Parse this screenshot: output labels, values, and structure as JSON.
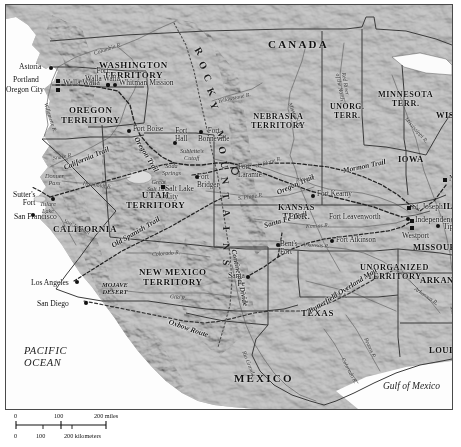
{
  "map": {
    "title": "Western United States Territories and Overland Trails, c. 1850s",
    "colors": {
      "land": "#b2b2b2",
      "ocean": "#ffffff",
      "border": "#3a3a3a",
      "trail": "#2b2b2b",
      "river": "#6b6b6b",
      "text": "#111111"
    },
    "countries": [
      {
        "name": "CANADA",
        "x": 262,
        "y": 33
      },
      {
        "name": "MEXICO",
        "x": 228,
        "y": 367
      }
    ],
    "territories": [
      {
        "name": "WASHINGTON\nTERRITORY",
        "x": 93,
        "y": 55,
        "size": 9
      },
      {
        "name": "OREGON\nTERRITORY",
        "x": 55,
        "y": 100,
        "size": 9
      },
      {
        "name": "UTAH\nTERRITORY",
        "x": 120,
        "y": 185,
        "size": 9
      },
      {
        "name": "NEW MEXICO\nTERRITORY",
        "x": 133,
        "y": 262,
        "size": 9
      },
      {
        "name": "NEBRASKA\nTERRITORY",
        "x": 245,
        "y": 107,
        "size": 8.2
      },
      {
        "name": "KANSAS\nTERR.",
        "x": 272,
        "y": 198,
        "size": 8.2
      },
      {
        "name": "UNORG.\nTERR.",
        "x": 324,
        "y": 98,
        "size": 7.8
      },
      {
        "name": "MINNESOTA\nTERR.",
        "x": 372,
        "y": 85,
        "size": 8.2
      },
      {
        "name": "UNORGANIZED\nTERRITORY",
        "x": 354,
        "y": 258,
        "size": 8.2
      },
      {
        "name": "CALIFORNIA",
        "x": 47,
        "y": 219,
        "size": 9
      },
      {
        "name": "TEXAS",
        "x": 295,
        "y": 303,
        "size": 9
      }
    ],
    "states": [
      {
        "name": "WIS.",
        "x": 430,
        "y": 105
      },
      {
        "name": "IOWA",
        "x": 392,
        "y": 149
      },
      {
        "name": "ILL.",
        "x": 437,
        "y": 196
      },
      {
        "name": "MISSOURI",
        "x": 407,
        "y": 237
      },
      {
        "name": "ARKANSAS",
        "x": 414,
        "y": 270
      },
      {
        "name": "LOUISIANA",
        "x": 423,
        "y": 340
      }
    ],
    "water_labels": [
      {
        "name": "PACIFIC\nOCEAN",
        "x": 18,
        "y": 340,
        "class": "ocean"
      },
      {
        "name": "Gulf of Mexico",
        "x": 377,
        "y": 376,
        "class": "gulf"
      }
    ],
    "mountains": [
      {
        "name": "ROCKY MOUNTAINS",
        "x": 196,
        "y": 40
      }
    ],
    "deserts": [
      {
        "name": "MOJAVE\nDESERT",
        "x": 96,
        "y": 276
      }
    ],
    "features": [
      {
        "name": "Great\nSalt Lake",
        "x": 141,
        "y": 174
      },
      {
        "name": "Donner\nPass",
        "x": 39,
        "y": 168
      },
      {
        "name": "Sublette's\nCutoff",
        "x": 174,
        "y": 143
      },
      {
        "name": "Soda\nSprings",
        "x": 156,
        "y": 158
      },
      {
        "name": "Tulare\nLake",
        "x": 34,
        "y": 196
      }
    ],
    "cities": [
      {
        "name": "Astoria",
        "x": 13,
        "y": 58,
        "marker": "dot",
        "mx": 43,
        "my": 61,
        "align": "right"
      },
      {
        "name": "Portland",
        "x": 7,
        "y": 71,
        "marker": "sq",
        "mx": 50,
        "my": 74,
        "align": "right"
      },
      {
        "name": "Oregon City",
        "x": 0,
        "y": 81,
        "marker": "sq",
        "mx": 50,
        "my": 83,
        "align": "right"
      },
      {
        "name": "Walla Walla",
        "x": 57,
        "y": 74,
        "marker": "dot",
        "mx": 100,
        "my": 78,
        "align": "right"
      },
      {
        "name": "Whitman Mission",
        "x": 113,
        "y": 74,
        "marker": "dot",
        "mx": 107,
        "my": 78,
        "align": "left"
      },
      {
        "name": "Salt Lake\nCity",
        "x": 159,
        "y": 180,
        "marker": "sq",
        "mx": 155,
        "my": 180,
        "align": "left"
      },
      {
        "name": "Sutter's\nFort",
        "x": 7,
        "y": 186,
        "marker": "dot",
        "mx": 45,
        "my": 192,
        "align": "right"
      },
      {
        "name": "San Francisco",
        "x": 8,
        "y": 208,
        "marker": "dot",
        "mx": 25,
        "my": 208,
        "align": "left"
      },
      {
        "name": "Los Angeles",
        "x": 25,
        "y": 274,
        "marker": "dot",
        "mx": 69,
        "my": 275,
        "align": "right"
      },
      {
        "name": "San Diego",
        "x": 31,
        "y": 295,
        "marker": "dot",
        "mx": 78,
        "my": 296,
        "align": "right"
      },
      {
        "name": "Santa\nFe",
        "x": 222,
        "y": 267,
        "marker": "dot",
        "mx": 240,
        "my": 270,
        "align": "right"
      },
      {
        "name": "St. Joseph",
        "x": 406,
        "y": 198,
        "marker": "sq",
        "mx": 401,
        "my": 201,
        "align": "left"
      },
      {
        "name": "Independence",
        "x": 409,
        "y": 211,
        "marker": "sq",
        "mx": 404,
        "my": 214,
        "align": "left"
      },
      {
        "name": "Westport",
        "x": 396,
        "y": 227,
        "marker": "sq",
        "mx": 404,
        "my": 221,
        "align": "right"
      },
      {
        "name": "Tipton",
        "x": 437,
        "y": 218,
        "marker": "dot",
        "mx": 430,
        "my": 219,
        "align": "left"
      },
      {
        "name": "Nauvoo",
        "x": 443,
        "y": 170,
        "marker": "sq",
        "mx": 437,
        "my": 173,
        "align": "left"
      }
    ],
    "forts": [
      {
        "name": "Fort\nWalla Walla",
        "x": 79,
        "y": 63,
        "marker": "dot",
        "mx": 100,
        "my": 78,
        "align": "center"
      },
      {
        "name": "Fort Boise",
        "x": 127,
        "y": 121,
        "marker": "dot",
        "mx": 121,
        "my": 124,
        "align": "left"
      },
      {
        "name": "Fort\nHall",
        "x": 169,
        "y": 123,
        "marker": "dot",
        "mx": 167,
        "my": 136,
        "align": "center"
      },
      {
        "name": "Fort\nBonneville",
        "x": 192,
        "y": 123,
        "marker": "dot",
        "mx": 193,
        "my": 125,
        "align": "center"
      },
      {
        "name": "Fort\nBridger",
        "x": 191,
        "y": 169,
        "marker": "dot",
        "mx": 189,
        "my": 170,
        "align": "left"
      },
      {
        "name": "Fort\nLaramie",
        "x": 232,
        "y": 159,
        "marker": "ring",
        "mx": 225,
        "my": 162,
        "align": "left"
      },
      {
        "name": "Fort Kearny",
        "x": 311,
        "y": 186,
        "marker": "dot",
        "mx": 305,
        "my": 189,
        "align": "left"
      },
      {
        "name": "Fort Leavenworth",
        "x": 323,
        "y": 209,
        "marker": "dot",
        "mx": 400,
        "my": 212,
        "align": "left"
      },
      {
        "name": "Fort Atkinson",
        "x": 330,
        "y": 232,
        "marker": "dot",
        "mx": 324,
        "my": 234,
        "align": "left"
      },
      {
        "name": "Bent's\nFort",
        "x": 274,
        "y": 236,
        "marker": "dot",
        "mx": 270,
        "my": 238,
        "align": "left"
      }
    ],
    "trails": [
      {
        "name": "Oregon Trail",
        "x": 130,
        "y": 128,
        "rot": 58
      },
      {
        "name": "Oregon Trail",
        "x": 271,
        "y": 183,
        "rot": -24
      },
      {
        "name": "California Trail",
        "x": 58,
        "y": 158,
        "rot": -23
      },
      {
        "name": "Mormon Trail",
        "x": 337,
        "y": 161,
        "rot": -12
      },
      {
        "name": "Santa Fe Trail",
        "x": 258,
        "y": 216,
        "rot": -16
      },
      {
        "name": "Old Spanish Trail",
        "x": 106,
        "y": 236,
        "rot": -30
      },
      {
        "name": "Butterfield Overland Mail",
        "x": 303,
        "y": 302,
        "rot": -32
      },
      {
        "name": "Oxbow Route",
        "x": 163,
        "y": 312,
        "rot": 19
      },
      {
        "name": "Continental Divide",
        "x": 228,
        "y": 240,
        "rot": 78
      }
    ],
    "rivers": [
      {
        "name": "Columbia R.",
        "x": 88,
        "y": 45,
        "rot": -18
      },
      {
        "name": "Willamette R.",
        "x": 40,
        "y": 95,
        "rot": 72
      },
      {
        "name": "Snake R.",
        "x": 47,
        "y": 150,
        "rot": -10
      },
      {
        "name": "Yellowstone R.",
        "x": 212,
        "y": 93,
        "rot": -12
      },
      {
        "name": "Missouri R.",
        "x": 284,
        "y": 95,
        "rot": 66
      },
      {
        "name": "Red River\nof the North",
        "x": 335,
        "y": 62,
        "rot": 80
      },
      {
        "name": "Mississippi R.",
        "x": 400,
        "y": 110,
        "rot": 48
      },
      {
        "name": "N. Platte R.",
        "x": 250,
        "y": 158,
        "rot": -18
      },
      {
        "name": "Platte R.",
        "x": 290,
        "y": 172,
        "rot": -8
      },
      {
        "name": "S. Platte R.",
        "x": 232,
        "y": 190,
        "rot": -8
      },
      {
        "name": "Kansas R.",
        "x": 300,
        "y": 218,
        "rot": -3
      },
      {
        "name": "Arkansas R.",
        "x": 296,
        "y": 236,
        "rot": 4
      },
      {
        "name": "Humboldt R.",
        "x": 77,
        "y": 175,
        "rot": 7
      },
      {
        "name": "San Joaquin\nR.",
        "x": 57,
        "y": 212,
        "rot": 26
      },
      {
        "name": "Colorado R.",
        "x": 146,
        "y": 246,
        "rot": -4
      },
      {
        "name": "Gila R.",
        "x": 164,
        "y": 288,
        "rot": 7
      },
      {
        "name": "Rio Grande",
        "x": 238,
        "y": 343,
        "rot": 68
      },
      {
        "name": "Red R.",
        "x": 327,
        "y": 285,
        "rot": 12
      },
      {
        "name": "Brazos R.",
        "x": 360,
        "y": 330,
        "rot": 66
      },
      {
        "name": "Colorado R.",
        "x": 337,
        "y": 350,
        "rot": 62
      },
      {
        "name": "Arkansas R.",
        "x": 409,
        "y": 280,
        "rot": 34
      },
      {
        "name": "Mississippi R.",
        "x": 446,
        "y": 298,
        "rot": 76
      }
    ],
    "scale": {
      "miles_ticks": [
        "0",
        "100",
        "200 miles"
      ],
      "km_ticks": [
        "0",
        "100",
        "200 kilometers"
      ]
    }
  }
}
